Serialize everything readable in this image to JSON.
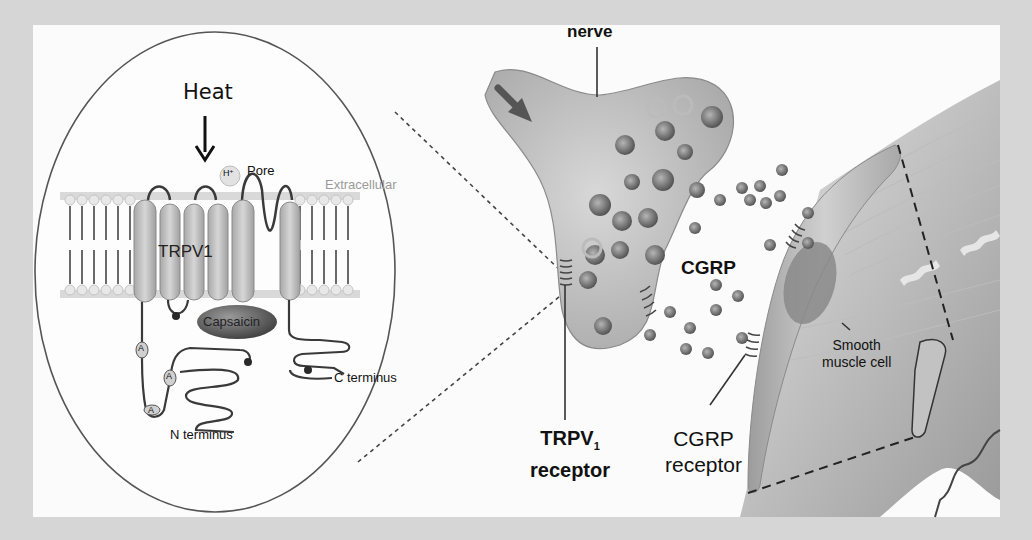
{
  "figure": {
    "colors": {
      "background_border": "#d6d6d6",
      "panel": "#fbfbfb",
      "membrane": "#b0b0b0",
      "helix": "#bdbdbd",
      "capsaicin": "#6e6e6e",
      "nerve": "#c4c4c4",
      "vesicle": "#8a8a8a",
      "muscle": "#b8b8b8",
      "ink": "#111111"
    }
  },
  "inset": {
    "heat_label": "Heat",
    "proton_label": "H⁺",
    "pore_label": "Pore",
    "extracellular_label": "Extracellular",
    "channel_label": "TRPV1",
    "ligand_label": "Capsaicin",
    "c_terminus_label": "C terminus",
    "n_terminus_label": "N terminus",
    "ankyrin_label": "A"
  },
  "main": {
    "nerve_label": "nerve",
    "cgrp_label": "CGRP",
    "trpv_receptor_label_line1": "TRPV",
    "trpv_receptor_subscript": "1",
    "trpv_receptor_label_line2": "receptor",
    "cgrp_receptor_label_line1": "CGRP",
    "cgrp_receptor_label_line2": "receptor",
    "smooth_muscle_label_line1": "Smooth",
    "smooth_muscle_label_line2": "muscle cell"
  }
}
